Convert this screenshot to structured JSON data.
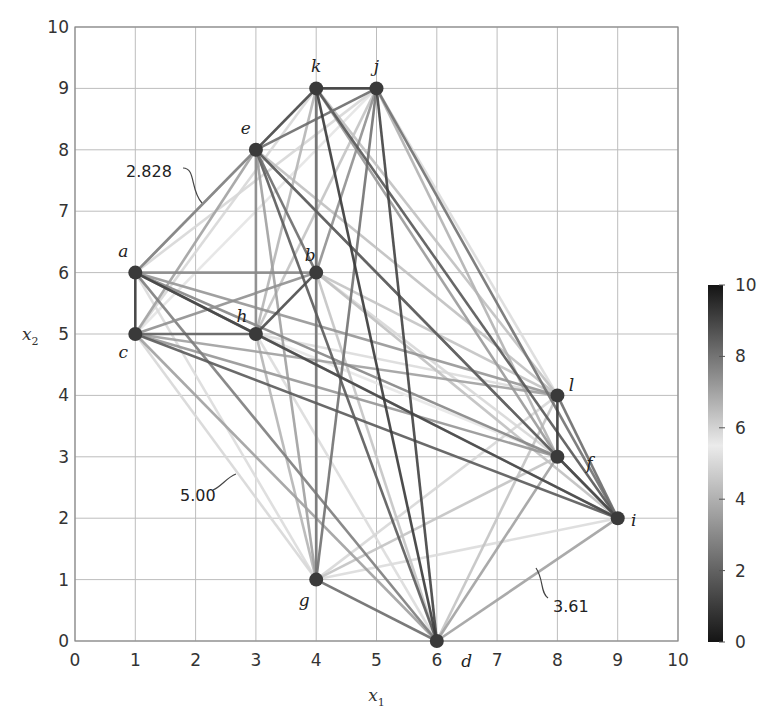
{
  "chart_data": {
    "type": "scatter",
    "subtype": "complete-graph-distance-network",
    "title": "",
    "xlabel": "x1",
    "ylabel": "x2",
    "xlim": [
      0,
      10
    ],
    "ylim": [
      0,
      10
    ],
    "xticks": [
      0,
      1,
      2,
      3,
      4,
      5,
      6,
      7,
      8,
      9,
      10
    ],
    "yticks": [
      0,
      1,
      2,
      3,
      4,
      5,
      6,
      7,
      8,
      9,
      10
    ],
    "grid": true,
    "nodes": [
      {
        "name": "a",
        "x": 1,
        "y": 6
      },
      {
        "name": "b",
        "x": 4,
        "y": 6
      },
      {
        "name": "c",
        "x": 1,
        "y": 5
      },
      {
        "name": "d",
        "x": 6,
        "y": 0
      },
      {
        "name": "e",
        "x": 3,
        "y": 8
      },
      {
        "name": "f",
        "x": 8,
        "y": 3
      },
      {
        "name": "g",
        "x": 4,
        "y": 1
      },
      {
        "name": "h",
        "x": 3,
        "y": 5
      },
      {
        "name": "i",
        "x": 9,
        "y": 2
      },
      {
        "name": "j",
        "x": 5,
        "y": 9
      },
      {
        "name": "k",
        "x": 4,
        "y": 9
      },
      {
        "name": "l",
        "x": 8,
        "y": 4
      }
    ],
    "edges": "all pairs (complete graph); edge color encodes Euclidean distance",
    "annotations": [
      {
        "text": "2.828",
        "edge": [
          "a",
          "e"
        ],
        "value": 2.828
      },
      {
        "text": "5.00",
        "edge": [
          "c",
          "g"
        ],
        "value": 5.0
      },
      {
        "text": "3.61",
        "edge": [
          "d",
          "i"
        ],
        "value": 3.61
      }
    ],
    "colorbar": {
      "range": [
        0,
        10
      ],
      "ticks": [
        0,
        2,
        4,
        6,
        8,
        10
      ],
      "colormap": "dark-light-dark gray (0 black, ~5.5 lightest, 10 black)"
    }
  }
}
